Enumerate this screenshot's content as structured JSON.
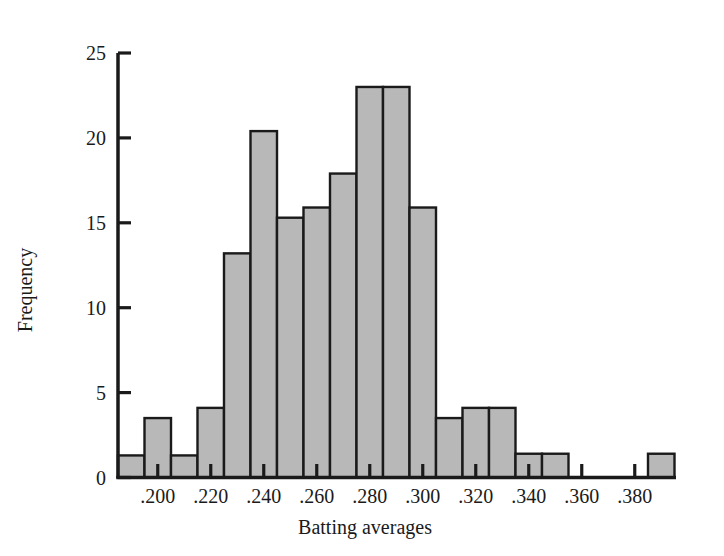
{
  "chart_data": {
    "type": "bar",
    "title": "",
    "subtitle": "",
    "xlabel": "Batting averages",
    "ylabel": "Frequency",
    "xlim": [
      0.185,
      0.395
    ],
    "ylim": [
      0,
      25
    ],
    "grid": false,
    "legend": null,
    "bin_width": 0.01,
    "x_tick_labels": [
      ".200",
      ".220",
      ".240",
      ".260",
      ".280",
      ".300",
      ".320",
      ".340",
      ".360",
      ".380"
    ],
    "x_tick_values": [
      0.2,
      0.22,
      0.24,
      0.26,
      0.28,
      0.3,
      0.32,
      0.34,
      0.36,
      0.38
    ],
    "y_tick_labels": [
      "0",
      "5",
      "10",
      "15",
      "20",
      "25"
    ],
    "y_tick_values": [
      0,
      5,
      10,
      15,
      20,
      25
    ],
    "bin_edges": [
      0.185,
      0.195,
      0.205,
      0.215,
      0.225,
      0.235,
      0.245,
      0.255,
      0.265,
      0.275,
      0.285,
      0.295,
      0.305,
      0.315,
      0.325,
      0.335,
      0.345,
      0.355,
      0.365,
      0.375,
      0.385,
      0.395
    ],
    "categories": [
      "0.185-0.195",
      "0.195-0.205",
      "0.205-0.215",
      "0.215-0.225",
      "0.225-0.235",
      "0.235-0.245",
      "0.245-0.255",
      "0.255-0.265",
      "0.265-0.275",
      "0.275-0.285",
      "0.285-0.295",
      "0.295-0.305",
      "0.305-0.315",
      "0.315-0.325",
      "0.325-0.335",
      "0.335-0.345",
      "0.345-0.355",
      "0.355-0.365",
      "0.365-0.375",
      "0.375-0.385",
      "0.385-0.395"
    ],
    "values": [
      1.3,
      3.5,
      1.3,
      4.1,
      13.2,
      20.4,
      15.3,
      15.9,
      17.9,
      23.0,
      23.0,
      15.9,
      3.5,
      4.1,
      4.1,
      1.4,
      1.4,
      0,
      0,
      0,
      1.4
    ],
    "bar_fill_color": "#b8b8b8",
    "bar_edge_color": "#1a1a1a",
    "axis_color": "#1a1a1a",
    "background_color": "#ffffff"
  }
}
